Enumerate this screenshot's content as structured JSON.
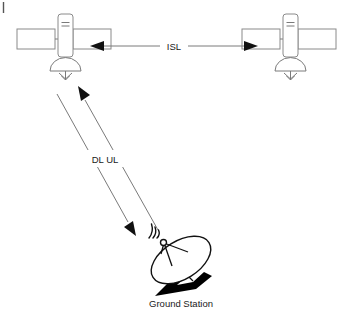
{
  "diagram": {
    "background_color": "#ffffff",
    "line_color": "#7a7a7a",
    "ink_color": "#111111",
    "nodes": [
      {
        "id": "satellite-left",
        "type": "satellite",
        "label": "",
        "x": 66,
        "y": 42,
        "has_solar_panels": true,
        "has_antenna": true
      },
      {
        "id": "satellite-right",
        "type": "satellite",
        "label": "",
        "x": 291,
        "y": 42,
        "has_solar_panels": true,
        "has_antenna": true
      },
      {
        "id": "ground-station",
        "type": "ground-station",
        "label": "Ground Station",
        "x": 180,
        "y": 262
      }
    ],
    "links": [
      {
        "id": "isl-link",
        "label": "ISL",
        "label_x": 173,
        "label_y": 46,
        "from": "satellite-left",
        "to": "satellite-right",
        "direction": "bidirectional",
        "style": "horizontal"
      },
      {
        "id": "downlink",
        "label": "DL",
        "from": "satellite-left",
        "to": "ground-station",
        "direction": "down",
        "style": "diagonal"
      },
      {
        "id": "uplink",
        "label": "UL",
        "from": "ground-station",
        "to": "satellite-left",
        "direction": "up",
        "style": "diagonal"
      }
    ],
    "labels": {
      "isl": "ISL",
      "dl_ul": "DL UL",
      "ground_station": "Ground Station"
    }
  }
}
